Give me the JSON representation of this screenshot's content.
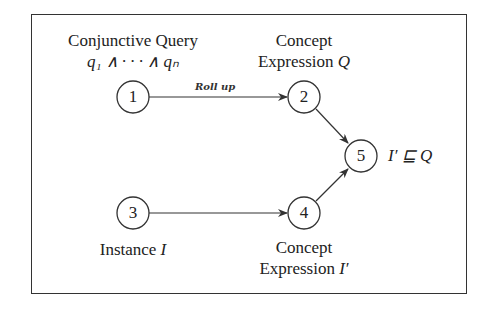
{
  "diagram": {
    "nodes": [
      {
        "id": "1",
        "label": "1",
        "caption_lines": [
          "Conjunctive Query",
          "q₁ ∧ · · · ∧ qₙ"
        ]
      },
      {
        "id": "2",
        "label": "2",
        "caption_lines": [
          "Concept",
          "Expression",
          "Q"
        ]
      },
      {
        "id": "3",
        "label": "3",
        "caption_lines": [
          "Instance",
          "I"
        ]
      },
      {
        "id": "4",
        "label": "4",
        "caption_lines": [
          "Concept",
          "Expression",
          "I′"
        ]
      },
      {
        "id": "5",
        "label": "5",
        "caption_lines": [
          "I′ ⊑ Q"
        ]
      }
    ],
    "edges": [
      {
        "from": "1",
        "to": "2",
        "label": "Roll up"
      },
      {
        "from": "3",
        "to": "4",
        "label": ""
      },
      {
        "from": "2",
        "to": "5",
        "label": ""
      },
      {
        "from": "4",
        "to": "5",
        "label": ""
      }
    ]
  }
}
